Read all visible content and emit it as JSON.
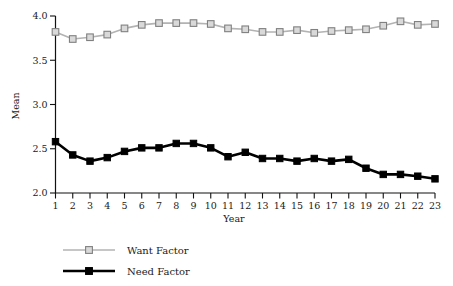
{
  "chart_data": {
    "type": "line",
    "title": "",
    "xlabel": "Year",
    "ylabel": "Mean",
    "xlim": [
      1,
      23
    ],
    "ylim": [
      2.0,
      4.0
    ],
    "grid": false,
    "legend_position": "bottom-left",
    "x": [
      1,
      2,
      3,
      4,
      5,
      6,
      7,
      8,
      9,
      10,
      11,
      12,
      13,
      14,
      15,
      16,
      17,
      18,
      19,
      20,
      21,
      22,
      23
    ],
    "xtick_labels": [
      "1",
      "2",
      "3",
      "4",
      "5",
      "6",
      "7",
      "8",
      "9",
      "10",
      "11",
      "12",
      "13",
      "14",
      "15",
      "16",
      "17",
      "18",
      "19",
      "20",
      "21",
      "22",
      "23"
    ],
    "ytick_labels": [
      "2.0",
      "2.5",
      "3.0",
      "3.5",
      "4.0"
    ],
    "yticks": [
      2.0,
      2.5,
      3.0,
      3.5,
      4.0
    ],
    "series": [
      {
        "name": "Want Factor",
        "color": "#b3b3b3",
        "marker": "open-square",
        "marker_fill": "#d9d9d9",
        "marker_stroke": "#808080",
        "line_width": 1.6,
        "values": [
          3.82,
          3.74,
          3.76,
          3.79,
          3.86,
          3.9,
          3.92,
          3.92,
          3.92,
          3.91,
          3.86,
          3.85,
          3.82,
          3.82,
          3.84,
          3.81,
          3.83,
          3.84,
          3.85,
          3.89,
          3.94,
          3.9,
          3.91
        ]
      },
      {
        "name": "Need Factor",
        "color": "#000000",
        "marker": "filled-square",
        "marker_fill": "#000000",
        "marker_stroke": "#000000",
        "line_width": 2.6,
        "values": [
          2.58,
          2.43,
          2.36,
          2.4,
          2.47,
          2.51,
          2.51,
          2.56,
          2.56,
          2.51,
          2.41,
          2.46,
          2.39,
          2.39,
          2.36,
          2.39,
          2.36,
          2.38,
          2.28,
          2.21,
          2.21,
          2.19,
          2.16
        ]
      }
    ]
  },
  "legend": {
    "items": [
      {
        "label": "Want Factor"
      },
      {
        "label": "Need Factor"
      }
    ]
  },
  "axes": {
    "x_title": "Year",
    "y_title": "Mean"
  }
}
